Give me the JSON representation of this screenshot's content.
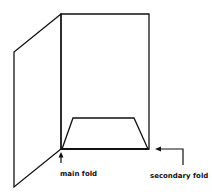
{
  "diagram": {
    "type": "folding-illustration",
    "labels": {
      "main_fold": "main fold",
      "secondary_fold": "secondary fold"
    },
    "colors": {
      "stroke": "#111111",
      "background": "#ffffff"
    }
  }
}
